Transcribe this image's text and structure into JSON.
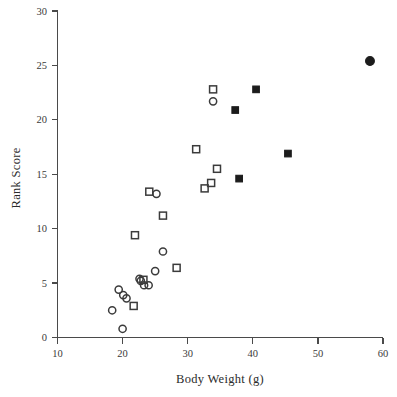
{
  "chart_data": {
    "type": "scatter",
    "title": "",
    "xlabel": "Body Weight (g)",
    "ylabel": "Rank Score",
    "xlim": [
      10,
      60
    ],
    "ylim": [
      0,
      30
    ],
    "xticks": [
      10,
      20,
      30,
      40,
      50,
      60
    ],
    "yticks": [
      0,
      5,
      10,
      15,
      20,
      25,
      30
    ],
    "grid": false,
    "legend": "none",
    "series": [
      {
        "name": "open-circle",
        "marker": "open circle",
        "points": [
          [
            18.4,
            2.5
          ],
          [
            19.4,
            4.4
          ],
          [
            20.0,
            0.8
          ],
          [
            20.1,
            3.9
          ],
          [
            20.6,
            3.6
          ],
          [
            22.6,
            5.4
          ],
          [
            22.8,
            5.2
          ],
          [
            23.3,
            4.8
          ],
          [
            24.0,
            4.8
          ],
          [
            25.0,
            6.1
          ],
          [
            25.2,
            13.2
          ],
          [
            26.2,
            7.9
          ],
          [
            33.9,
            21.7
          ]
        ]
      },
      {
        "name": "open-square",
        "marker": "open square",
        "points": [
          [
            21.7,
            2.9
          ],
          [
            21.9,
            9.4
          ],
          [
            23.2,
            5.3
          ],
          [
            24.1,
            13.4
          ],
          [
            26.2,
            11.2
          ],
          [
            28.3,
            6.4
          ],
          [
            31.3,
            17.3
          ],
          [
            32.6,
            13.7
          ],
          [
            33.6,
            14.2
          ],
          [
            33.9,
            22.8
          ],
          [
            34.5,
            15.5
          ]
        ]
      },
      {
        "name": "filled-square",
        "marker": "filled square",
        "points": [
          [
            37.3,
            20.9
          ],
          [
            37.9,
            14.6
          ],
          [
            40.5,
            22.8
          ],
          [
            45.4,
            16.9
          ]
        ]
      },
      {
        "name": "filled-circle",
        "marker": "filled circle",
        "points": [
          [
            58.0,
            25.4
          ]
        ]
      }
    ]
  },
  "axes": {
    "x_tick_labels": [
      "10",
      "20",
      "30",
      "40",
      "50",
      "60"
    ],
    "y_tick_labels": [
      "0",
      "5",
      "10",
      "15",
      "20",
      "25",
      "30"
    ],
    "x_title": "Body Weight (g)",
    "y_title": "Rank Score"
  },
  "colors": {
    "axis": "#4a4a4a",
    "marker_open_stroke": "#3b3b3b",
    "marker_filled": "#1c1c1c",
    "text": "#2b2b2b",
    "background": "#ffffff"
  }
}
